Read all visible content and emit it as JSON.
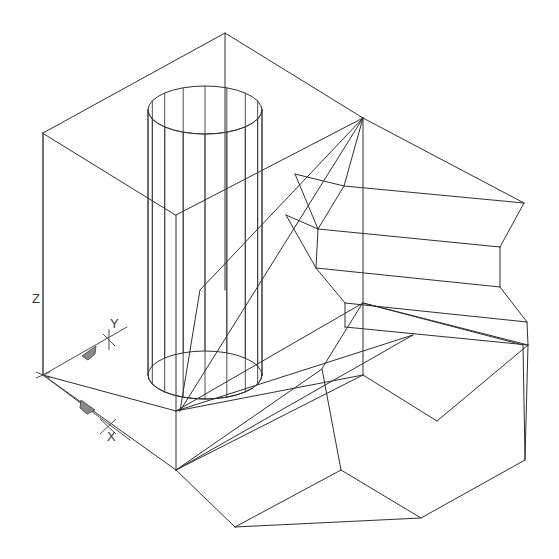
{
  "viewport": {
    "width": 559,
    "height": 559,
    "background_color": "#ffffff",
    "line_color": "#2f2f2f",
    "title": "3D Wireframe Isometric View"
  },
  "ucs": {
    "name": "ucs-icon",
    "origin": {
      "x": 43,
      "y": 375
    },
    "axes": [
      {
        "id": "z",
        "label": "Z",
        "label_x": 32,
        "label_y": 300,
        "tip_x": 43,
        "tip_y": 133,
        "cone": false
      },
      {
        "id": "y",
        "label": "Y",
        "label_x": 110,
        "label_y": 343,
        "tip_x": 121,
        "tip_y": 331,
        "cone": true
      },
      {
        "id": "x",
        "label": "X",
        "label_x": 107,
        "label_y": 438,
        "tip_x": 118,
        "tip_y": 429,
        "cone": true
      }
    ]
  },
  "geometry": {
    "box": {
      "name": "rectangular-box-solid",
      "description": "Large rectangular box wireframe forming the base block",
      "vertices": {
        "top_back": {
          "x": 225,
          "y": 33
        },
        "top_left": {
          "x": 43,
          "y": 133
        },
        "top_right": {
          "x": 363,
          "y": 118
        },
        "top_front": {
          "x": 176,
          "y": 215
        },
        "bot_left": {
          "x": 43,
          "y": 375
        },
        "bot_front": {
          "x": 176,
          "y": 470
        },
        "bot_right": {
          "x": 363,
          "y": 375
        }
      }
    },
    "cylinder": {
      "name": "tessellated-cylinder-solid",
      "description": "Vertical cylinder with tessellation lines passing through the box",
      "center_x": 205,
      "top_center_y": 110,
      "bottom_center_y": 375,
      "radius_x": 57,
      "radius_y": 24,
      "tessellation_segments": 16
    },
    "chamfered_block": {
      "name": "chamfered-prismatic-block",
      "description": "Angled chamfered prism extending to the right of the box",
      "segments": 8
    },
    "hex_face": {
      "name": "hexagonal-end-face",
      "description": "Hexagonal end face at lower right of the prismatic extrusion",
      "sides": 6
    }
  }
}
